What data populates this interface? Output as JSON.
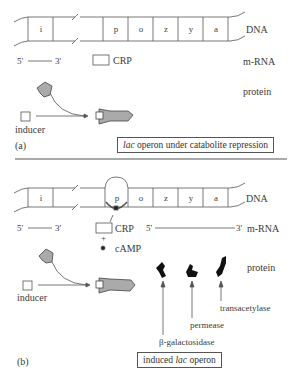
{
  "panel_a": {
    "genes": [
      "i",
      "p",
      "o",
      "z",
      "y",
      "a"
    ],
    "row_labels": {
      "dna": "DNA",
      "mrna": "m-RNA",
      "protein": "protein"
    },
    "mrna_5": "5'",
    "mrna_3": "3'",
    "crp_label": "CRP",
    "inducer_label": "inducer",
    "panel_label": "(a)",
    "caption_italic": "lac",
    "caption_rest": " operon under catabolite repression"
  },
  "panel_b": {
    "genes": [
      "i",
      "p",
      "o",
      "z",
      "y",
      "a"
    ],
    "row_labels": {
      "dna": "DNA",
      "mrna": "m-RNA",
      "protein": "protein"
    },
    "mrna_left_5": "5'",
    "mrna_left_3": "3'",
    "mrna_right_5": "5'",
    "mrna_right_3": "3'",
    "crp_label": "CRP",
    "plus": "+",
    "camp_label": "cAMP",
    "inducer_label": "inducer",
    "enzymes": [
      "transacetylase",
      "permease",
      "β-galactosidase"
    ],
    "panel_label": "(b)",
    "caption_pre": "induced ",
    "caption_italic": "lac",
    "caption_rest": " operon"
  }
}
